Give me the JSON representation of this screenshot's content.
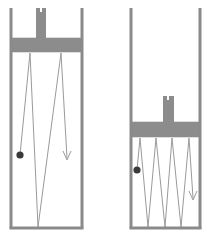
{
  "figure": {
    "caption": "",
    "width": 212,
    "height": 240,
    "background": "#ffffff"
  },
  "colors": {
    "wall": "#8a8a8a",
    "wall_shadow": "#b0b0b0",
    "piston_fill": "#8c8c8c",
    "piston_stroke": "#8c8c8c",
    "rod_fill": "#8c8c8c",
    "path_stroke": "#9a9a9a",
    "particle_fill": "#3a3a3a",
    "arrow_stroke": "#9a9a9a",
    "interior": "#ffffff"
  },
  "strokes": {
    "wall_width": 3.0,
    "path_width": 1.0,
    "arrow_width": 1.0
  },
  "panels": [
    {
      "id": "left-panel",
      "name": "expanded-cylinder",
      "label": "",
      "cylinder": {
        "left_wall_x": 11,
        "right_wall_x": 82,
        "top_y": 8,
        "floor_y": 228,
        "inner_left": 13,
        "inner_right": 80
      },
      "piston": {
        "x": 11,
        "y": 38,
        "width": 71,
        "height": 14,
        "face_y": 52
      },
      "rod": {
        "x": 36,
        "y": 8,
        "width": 10,
        "height": 30,
        "notch_x": 40,
        "notch_y": 8,
        "notch_width": 2,
        "notch_height": 4
      },
      "particle": {
        "cx": 20,
        "cy": 155,
        "r": 3.6
      },
      "arrow": {
        "x": 67,
        "y_tip": 160,
        "head_width": 8,
        "head_height": 9
      },
      "path_points": [
        [
          20,
          155
        ],
        [
          30,
          53
        ],
        [
          38,
          227
        ],
        [
          61,
          53
        ],
        [
          67,
          158
        ]
      ],
      "bounce_count": 3,
      "gas_volume_state": "large"
    },
    {
      "id": "right-panel",
      "name": "compressed-cylinder",
      "label": "",
      "cylinder": {
        "left_wall_x": 131,
        "right_wall_x": 200,
        "top_y": 8,
        "floor_y": 228,
        "inner_left": 133,
        "inner_right": 198
      },
      "piston": {
        "x": 131,
        "y": 122,
        "width": 69,
        "height": 15,
        "face_y": 137
      },
      "rod": {
        "x": 163,
        "y": 96,
        "width": 11,
        "height": 26,
        "notch_x": 167,
        "notch_y": 96,
        "notch_width": 2,
        "notch_height": 4
      },
      "particle": {
        "cx": 137,
        "cy": 170,
        "r": 3.6
      },
      "arrow": {
        "x": 193,
        "y_tip": 200,
        "head_width": 8,
        "head_height": 9
      },
      "path_points": [
        [
          137,
          170
        ],
        [
          140,
          138
        ],
        [
          148,
          227
        ],
        [
          156,
          138
        ],
        [
          165,
          227
        ],
        [
          172,
          138
        ],
        [
          181,
          227
        ],
        [
          189,
          138
        ],
        [
          193,
          198
        ]
      ],
      "bounce_count": 8,
      "gas_volume_state": "small"
    }
  ]
}
